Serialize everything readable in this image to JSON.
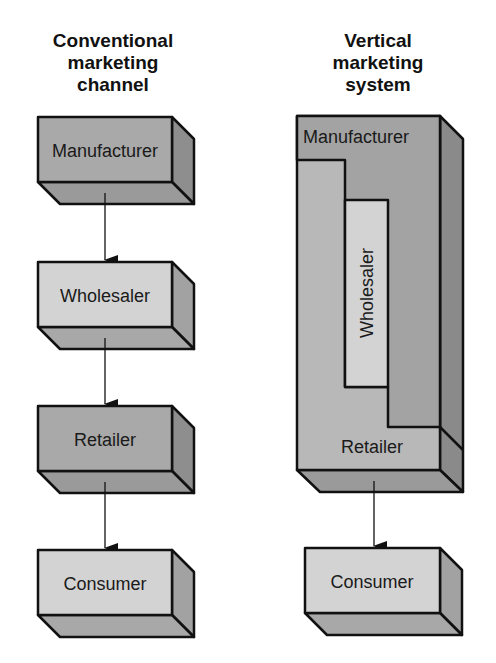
{
  "left": {
    "title_lines": [
      "Conventional",
      "marketing",
      "channel"
    ],
    "boxes": [
      {
        "label": "Manufacturer",
        "shade": "dark"
      },
      {
        "label": "Wholesaler",
        "shade": "light"
      },
      {
        "label": "Retailer",
        "shade": "dark"
      },
      {
        "label": "Consumer",
        "shade": "light"
      }
    ]
  },
  "right": {
    "title_lines": [
      "Vertical",
      "marketing",
      "system"
    ],
    "system_labels": {
      "manufacturer": "Manufacturer",
      "wholesaler": "Wholesaler",
      "retailer": "Retailer"
    },
    "consumer": {
      "label": "Consumer"
    }
  },
  "colors": {
    "dark_front": "#a9a9a9",
    "light_front": "#d3d3d3",
    "side": "#8e8e8e",
    "bottom": "#9a9a9a",
    "stroke": "#111111"
  }
}
